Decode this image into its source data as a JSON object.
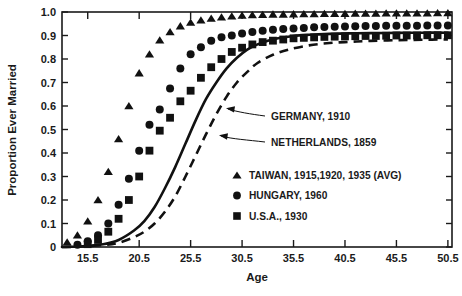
{
  "chart_data": {
    "type": "scatter",
    "title": "",
    "xlabel": "Age",
    "ylabel": "Proportion Ever Married",
    "xlim": [
      13.0,
      50.9
    ],
    "ylim": [
      0,
      1.0
    ],
    "grid": false,
    "legend_position": "inside-lower-right",
    "xticks": [
      "15.5",
      "20.5",
      "25.5",
      "30.5",
      "35.5",
      "40.5",
      "45.5",
      "50.5"
    ],
    "xtick_values": [
      15.5,
      20.5,
      25.5,
      30.5,
      35.5,
      40.5,
      45.5,
      50.5
    ],
    "yticks": [
      "0",
      "0.1",
      "0.2",
      "0.3",
      "0.4",
      "0.5",
      "0.6",
      "0.7",
      "0.8",
      "0.9",
      "1.0"
    ],
    "ytick_values": [
      0,
      0.1,
      0.2,
      0.3,
      0.4,
      0.5,
      0.6,
      0.7,
      0.8,
      0.9,
      1.0
    ],
    "series": [
      {
        "name": "TAIWAN, 1915,1920, 1935 (AVG)",
        "marker": "triangle",
        "style": "markers",
        "color": "#111111",
        "x": [
          13.5,
          14.5,
          15.5,
          16.5,
          17.5,
          18.5,
          19.5,
          20.5,
          21.5,
          22.5,
          23.5,
          24.5,
          25.5,
          26.5,
          27.5,
          28.5,
          29.5,
          30.5,
          31.5,
          32.5,
          33.5,
          34.5,
          35.5,
          36.5,
          37.5,
          38.5,
          39.5,
          40.5,
          41.5,
          42.5,
          43.5,
          44.5,
          45.5,
          46.5,
          47.5,
          48.5,
          49.5,
          50.5
        ],
        "y": [
          0.02,
          0.05,
          0.11,
          0.2,
          0.32,
          0.46,
          0.6,
          0.74,
          0.82,
          0.88,
          0.915,
          0.94,
          0.955,
          0.965,
          0.972,
          0.978,
          0.982,
          0.985,
          0.987,
          0.988,
          0.99,
          0.99,
          0.991,
          0.992,
          0.992,
          0.993,
          0.993,
          0.993,
          0.994,
          0.994,
          0.994,
          0.995,
          0.995,
          0.995,
          0.995,
          0.995,
          0.996,
          0.996
        ]
      },
      {
        "name": "HUNGARY, 1960",
        "marker": "circle",
        "style": "markers",
        "color": "#111111",
        "x": [
          14.5,
          15.5,
          16.5,
          17.5,
          18.5,
          19.5,
          20.5,
          21.5,
          22.5,
          23.5,
          24.5,
          25.5,
          26.5,
          27.5,
          28.5,
          29.5,
          30.5,
          31.5,
          32.5,
          33.5,
          34.5,
          35.5,
          36.5,
          37.5,
          38.5,
          39.5,
          40.5,
          41.5,
          42.5,
          43.5,
          44.5,
          45.5,
          46.5,
          47.5,
          48.5,
          49.5,
          50.5
        ],
        "y": [
          0.01,
          0.025,
          0.05,
          0.1,
          0.18,
          0.29,
          0.41,
          0.52,
          0.585,
          0.675,
          0.76,
          0.82,
          0.85,
          0.878,
          0.893,
          0.9,
          0.908,
          0.915,
          0.92,
          0.925,
          0.928,
          0.93,
          0.932,
          0.935,
          0.936,
          0.937,
          0.938,
          0.939,
          0.94,
          0.94,
          0.941,
          0.941,
          0.942,
          0.942,
          0.943,
          0.943,
          0.943
        ]
      },
      {
        "name": "U.S.A., 1930",
        "marker": "square",
        "style": "markers",
        "color": "#111111",
        "x": [
          15.5,
          16.5,
          17.5,
          18.5,
          19.5,
          20.5,
          21.5,
          22.5,
          23.5,
          24.5,
          25.5,
          26.5,
          27.5,
          28.5,
          29.5,
          30.5,
          31.5,
          32.5,
          33.5,
          34.5,
          35.5,
          36.5,
          37.5,
          38.5,
          39.5,
          40.5,
          41.5,
          42.5,
          43.5,
          44.5,
          45.5,
          46.5,
          47.5,
          48.5,
          49.5,
          50.5
        ],
        "y": [
          0.012,
          0.03,
          0.065,
          0.12,
          0.2,
          0.3,
          0.41,
          0.495,
          0.55,
          0.62,
          0.665,
          0.72,
          0.765,
          0.8,
          0.83,
          0.848,
          0.862,
          0.872,
          0.878,
          0.883,
          0.888,
          0.89,
          0.892,
          0.894,
          0.895,
          0.896,
          0.897,
          0.898,
          0.898,
          0.899,
          0.9,
          0.9,
          0.9,
          0.901,
          0.901,
          0.901
        ]
      },
      {
        "name": "GERMANY, 1910",
        "marker": "none",
        "style": "solid-line",
        "color": "#111111",
        "x": [
          13.0,
          15.0,
          17.0,
          18.5,
          20.0,
          21.0,
          22.0,
          23.0,
          24.0,
          25.0,
          26.0,
          27.0,
          28.0,
          29.0,
          30.0,
          31.0,
          32.0,
          33.0,
          34.0,
          35.5,
          37.0,
          39.0,
          41.0,
          43.0,
          45.5,
          48.0,
          50.5
        ],
        "y": [
          0.0,
          0.003,
          0.012,
          0.03,
          0.07,
          0.11,
          0.17,
          0.25,
          0.34,
          0.44,
          0.54,
          0.63,
          0.7,
          0.76,
          0.805,
          0.84,
          0.862,
          0.878,
          0.888,
          0.898,
          0.903,
          0.907,
          0.909,
          0.91,
          0.911,
          0.912,
          0.912
        ]
      },
      {
        "name": "NETHERLANDS, 1859",
        "marker": "none",
        "style": "dashed-line",
        "color": "#111111",
        "x": [
          13.0,
          15.0,
          17.0,
          18.5,
          20.0,
          21.0,
          22.0,
          23.0,
          24.0,
          25.0,
          26.0,
          27.0,
          28.0,
          29.0,
          30.0,
          31.0,
          32.0,
          33.5,
          35.0,
          37.0,
          39.0,
          41.0,
          43.0,
          45.5,
          48.0,
          50.5
        ],
        "y": [
          0.0,
          0.002,
          0.008,
          0.018,
          0.042,
          0.065,
          0.1,
          0.15,
          0.215,
          0.3,
          0.39,
          0.48,
          0.565,
          0.64,
          0.7,
          0.745,
          0.783,
          0.818,
          0.84,
          0.858,
          0.868,
          0.873,
          0.877,
          0.88,
          0.882,
          0.883
        ]
      }
    ],
    "annotations": [
      {
        "text": "GERMANY, 1910",
        "target_series": "GERMANY, 1910"
      },
      {
        "text": "NETHERLANDS, 1859",
        "target_series": "NETHERLANDS, 1859"
      }
    ],
    "legend_entries": [
      {
        "label": "TAIWAN, 1915,1920, 1935 (AVG)",
        "marker": "triangle"
      },
      {
        "label": "HUNGARY, 1960",
        "marker": "circle"
      },
      {
        "label": "U.S.A., 1930",
        "marker": "square"
      }
    ]
  }
}
